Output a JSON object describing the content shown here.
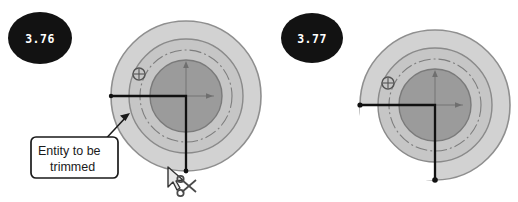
{
  "page": {
    "background_color": "#ffffff",
    "width": 518,
    "height": 202
  },
  "palette": {
    "background": "#ffffff",
    "outer_ring_fill": "#d2d2d2",
    "outer_ring_stroke": "#8f8f8f",
    "middle_ring_fill": "#c2c2c2",
    "middle_ring_stroke": "#8a8a8a",
    "inner_disc_fill": "#9b9b9b",
    "inner_disc_stroke": "#7a7a7a",
    "construction_line": "#7d7d7d",
    "entity_line": "#111111",
    "badge_fill": "#121212",
    "badge_text": "#ffffff",
    "callout_stroke": "#1a1a1a",
    "callout_fill": "#ffffff",
    "callout_text": "#1a1a1a",
    "cursor_fill": "#e8e8e8",
    "cursor_stroke": "#333333",
    "scissors": "#4a4a4a"
  },
  "figures": [
    {
      "id": "figure-3-76",
      "badge_label": "3.76",
      "caption_label": "Entity to be trimmed",
      "state": "before-trim",
      "has_callout": true,
      "has_cursor": true,
      "has_scissors": true,
      "geometry": {
        "center_x": 186,
        "center_y": 96,
        "outer_radius": 75,
        "middle_radius": 57,
        "construction_radius": 46,
        "inner_radius": 36,
        "entity_line_x": 186,
        "entity_line_y": 96,
        "entity_left_x": 111,
        "entity_bottom_y": 171
      },
      "markers": [
        {
          "name": "coincident-marker",
          "x": 139,
          "y": 74,
          "radius": 6
        }
      ],
      "axes": {
        "x_arrow_x": 208,
        "y_arrow_y": 66
      }
    },
    {
      "id": "figure-3-77",
      "badge_label": "3.77",
      "caption_label": "",
      "state": "after-trim",
      "has_callout": false,
      "has_cursor": false,
      "has_scissors": false,
      "geometry": {
        "center_x": 176,
        "center_y": 105,
        "outer_radius": 75,
        "middle_radius": 57,
        "construction_radius": 46,
        "inner_radius": 36,
        "entity_line_x": 176,
        "entity_line_y": 105,
        "entity_left_x": 101,
        "entity_bottom_y": 180
      },
      "markers": [
        {
          "name": "coincident-marker",
          "x": 129,
          "y": 83,
          "radius": 6
        }
      ],
      "axes": {
        "x_arrow_x": 198,
        "y_arrow_y": 75
      },
      "trim_note": "lower-left quadrant of outer ring removed"
    }
  ],
  "badges": {
    "left": {
      "label": "3.76",
      "cx": 40,
      "cy": 38,
      "rx": 32,
      "ry": 26
    },
    "right": {
      "label": "3.77",
      "cx": 53,
      "cy": 38,
      "rx": 31,
      "ry": 25
    }
  },
  "callout": {
    "line1": "Entity to be",
    "line2": "trimmed",
    "box_x": 31,
    "box_y": 137,
    "box_w": 87,
    "box_h": 41
  },
  "icons": {
    "coincident": "coincident-constraint-icon",
    "scissors": "scissors-icon",
    "cursor": "mouse-pointer-icon",
    "x_axis": "x-axis-arrow-icon",
    "y_axis": "y-axis-arrow-icon"
  }
}
